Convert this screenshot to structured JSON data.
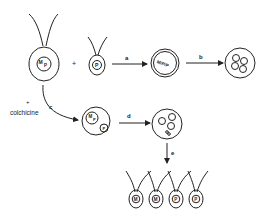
{
  "diagram": {
    "title": "",
    "cells": {
      "parent_large": {
        "nucleus_label_1": "M",
        "nucleus_label_2": "P"
      },
      "parent_small": {
        "nucleus_label": "P"
      },
      "fused": {
        "label": "M/P/P"
      },
      "colchicine_fused": {
        "nucleus_1": "M",
        "nucleus_1b": "P",
        "nucleus_2": "P"
      },
      "progeny": [
        {
          "label": "M"
        },
        {
          "label": "M"
        },
        {
          "label": "P"
        },
        {
          "label": "P"
        }
      ]
    },
    "operators": {
      "plus": "+",
      "colchicine_plus": "+",
      "colchicine": "colchicine"
    },
    "arrows": {
      "a": "a",
      "b": "b",
      "c": "c",
      "d": "d",
      "e": "e"
    }
  }
}
